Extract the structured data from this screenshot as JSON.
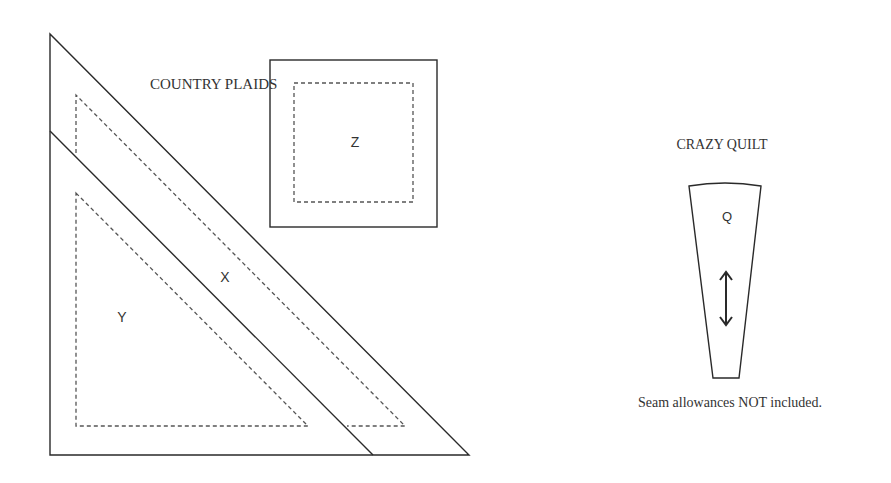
{
  "sections": {
    "country_plaids": {
      "title": "COUNTRY PLAIDS",
      "pieces": [
        {
          "label": "X",
          "shape": "triangle strip"
        },
        {
          "label": "Y",
          "shape": "triangle"
        },
        {
          "label": "Z",
          "shape": "square"
        }
      ]
    },
    "crazy_quilt": {
      "title": "CRAZY QUILT",
      "pieces": [
        {
          "label": "Q",
          "shape": "wedge",
          "grain_arrow": "vertical double arrow"
        }
      ]
    }
  },
  "note": "Seam allowances NOT included.",
  "colors": {
    "line": "#2a2a2a",
    "dashed": "#555555",
    "background": "#ffffff"
  }
}
